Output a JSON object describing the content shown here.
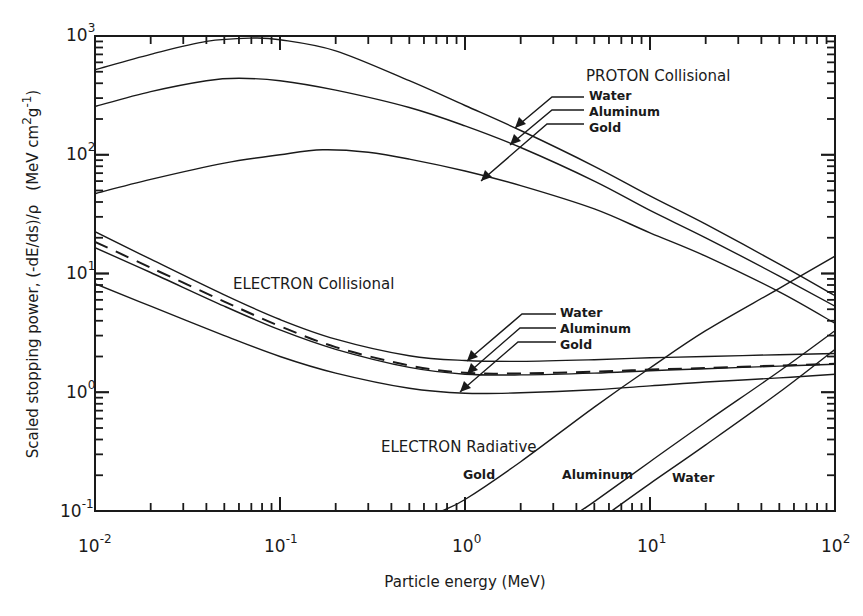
{
  "chart_data": {
    "type": "line",
    "scale": {
      "x": "log",
      "y": "log"
    },
    "title": "",
    "xlabel": "Particle energy (MeV)",
    "ylabel": "Scaled stopping power, (-dE/ds)/ρ  (MeV cm²g⁻¹)",
    "xlim": [
      0.01,
      100
    ],
    "ylim": [
      0.1,
      1000
    ],
    "x_ticks": [
      {
        "base": "10",
        "exp": "-2",
        "value": 0.01
      },
      {
        "base": "10",
        "exp": "-1",
        "value": 0.1
      },
      {
        "base": "10",
        "exp": "0",
        "value": 1
      },
      {
        "base": "10",
        "exp": "1",
        "value": 10
      },
      {
        "base": "10",
        "exp": "2",
        "value": 100
      }
    ],
    "y_ticks": [
      {
        "base": "10",
        "exp": "-1",
        "value": 0.1
      },
      {
        "base": "10",
        "exp": "0",
        "value": 1
      },
      {
        "base": "10",
        "exp": "1",
        "value": 10
      },
      {
        "base": "10",
        "exp": "2",
        "value": 100
      },
      {
        "base": "10",
        "exp": "3",
        "value": 1000
      }
    ],
    "grid": false,
    "legend": "inline annotations with leader arrows",
    "series": [
      {
        "name": "PROTON Collisional - Water",
        "group": "proton-collisional",
        "material": "Water",
        "style": "solid",
        "x": [
          0.01,
          0.02,
          0.04,
          0.07,
          0.1,
          0.2,
          0.5,
          1,
          2,
          5,
          10,
          20,
          50,
          100
        ],
        "y": [
          520,
          700,
          900,
          960,
          930,
          750,
          420,
          260,
          160,
          80,
          45,
          26,
          12,
          6.5
        ]
      },
      {
        "name": "PROTON Collisional - Aluminum",
        "group": "proton-collisional",
        "material": "Aluminum",
        "style": "solid",
        "x": [
          0.01,
          0.02,
          0.04,
          0.06,
          0.1,
          0.2,
          0.5,
          1,
          2,
          5,
          10,
          20,
          50,
          100
        ],
        "y": [
          255,
          340,
          420,
          440,
          420,
          350,
          250,
          175,
          115,
          60,
          34,
          20,
          9.5,
          5.3
        ]
      },
      {
        "name": "PROTON Collisional - Gold",
        "group": "proton-collisional",
        "material": "Gold",
        "style": "solid",
        "x": [
          0.01,
          0.02,
          0.05,
          0.1,
          0.17,
          0.3,
          0.5,
          1,
          2,
          5,
          10,
          20,
          50,
          100
        ],
        "y": [
          47,
          62,
          85,
          100,
          110,
          105,
          92,
          73,
          55,
          35,
          22,
          14,
          7,
          3.8
        ]
      },
      {
        "name": "ELECTRON Collisional - Water",
        "group": "electron-collisional",
        "material": "Water",
        "style": "solid",
        "x": [
          0.01,
          0.02,
          0.05,
          0.1,
          0.2,
          0.5,
          1,
          2,
          5,
          10,
          20,
          50,
          100
        ],
        "y": [
          22.5,
          13.2,
          6.6,
          4.1,
          2.8,
          2.03,
          1.85,
          1.82,
          1.88,
          1.95,
          2.0,
          2.07,
          2.12
        ]
      },
      {
        "name": "ELECTRON Collisional - Aluminum (dashed)",
        "group": "electron-collisional",
        "material": "Aluminum",
        "style": "dashed",
        "x": [
          0.01,
          0.02,
          0.05,
          0.1,
          0.2,
          0.5,
          1,
          2,
          5,
          10,
          20,
          50,
          100
        ],
        "y": [
          18.5,
          11.2,
          5.8,
          3.6,
          2.4,
          1.68,
          1.46,
          1.44,
          1.49,
          1.55,
          1.6,
          1.68,
          1.74
        ]
      },
      {
        "name": "ELECTRON Collisional - Gold",
        "group": "electron-collisional",
        "material": "Gold",
        "style": "solid",
        "x": [
          0.01,
          0.02,
          0.05,
          0.1,
          0.2,
          0.5,
          1,
          2,
          5,
          10,
          20,
          50,
          100
        ],
        "y": [
          8.2,
          5.3,
          3.0,
          2.0,
          1.45,
          1.08,
          0.98,
          0.99,
          1.05,
          1.13,
          1.22,
          1.32,
          1.42
        ]
      },
      {
        "name": "ELECTRON Collisional - additional solid curve",
        "group": "electron-collisional",
        "material": "",
        "style": "solid",
        "x": [
          0.01,
          0.02,
          0.05,
          0.1,
          0.2,
          0.5,
          1,
          2,
          5,
          10,
          20,
          50,
          100
        ],
        "y": [
          16.5,
          10.2,
          5.3,
          3.35,
          2.3,
          1.62,
          1.42,
          1.4,
          1.45,
          1.52,
          1.58,
          1.66,
          1.72
        ]
      },
      {
        "name": "ELECTRON Radiative - Gold",
        "group": "electron-radiative",
        "material": "Gold",
        "style": "solid",
        "x": [
          0.75,
          1,
          2,
          5,
          10,
          20,
          50,
          100
        ],
        "y": [
          0.1,
          0.125,
          0.26,
          0.75,
          1.6,
          3.3,
          7.5,
          14
        ]
      },
      {
        "name": "ELECTRON Radiative - Aluminum",
        "group": "electron-radiative",
        "material": "Aluminum",
        "style": "solid",
        "x": [
          4.2,
          5,
          10,
          20,
          50,
          100
        ],
        "y": [
          0.1,
          0.12,
          0.26,
          0.56,
          1.5,
          3.3
        ]
      },
      {
        "name": "ELECTRON Radiative - Water",
        "group": "electron-radiative",
        "material": "Water",
        "style": "solid",
        "x": [
          6.2,
          10,
          20,
          50,
          100
        ],
        "y": [
          0.1,
          0.17,
          0.36,
          1.0,
          2.3
        ]
      }
    ],
    "annotations": [
      {
        "text": "PROTON Collisional",
        "x": 2.8,
        "y": 600
      },
      {
        "text": "ELECTRON Collisional",
        "x": 0.025,
        "y": 7
      },
      {
        "text": "ELECTRON Radiative",
        "x": 0.25,
        "y": 0.45
      },
      {
        "text": "Water",
        "x": 3.6,
        "y": 330,
        "points_to_series": "PROTON Collisional - Water"
      },
      {
        "text": "Aluminum",
        "x": 3.6,
        "y": 250,
        "points_to_series": "PROTON Collisional - Aluminum"
      },
      {
        "text": "Gold",
        "x": 3.6,
        "y": 190,
        "points_to_series": "PROTON Collisional - Gold"
      },
      {
        "text": "Water",
        "x": 3.0,
        "y": 2.9,
        "points_to_series": "ELECTRON Collisional - Water"
      },
      {
        "text": "Aluminum",
        "x": 3.0,
        "y": 2.3,
        "points_to_series": "ELECTRON Collisional - Aluminum (dashed)"
      },
      {
        "text": "Gold",
        "x": 3.0,
        "y": 1.8,
        "points_to_series": "ELECTRON Collisional - Gold"
      },
      {
        "text": "Gold",
        "x": 0.42,
        "y": 0.22,
        "labels_series": "ELECTRON Radiative - Gold"
      },
      {
        "text": "Aluminum",
        "x": 3.0,
        "y": 0.22,
        "labels_series": "ELECTRON Radiative - Aluminum"
      },
      {
        "text": "Water",
        "x": 11,
        "y": 0.2,
        "labels_series": "ELECTRON Radiative - Water"
      }
    ]
  },
  "labels": {
    "x_axis_title": "Particle energy (MeV)",
    "y_axis_title": "Scaled stopping power, (-dE/ds)/ρ  (MeV cm²g⁻¹)",
    "y_axis_title_main": "Scaled stopping power, (-dE/ds)/ρ",
    "y_axis_unit_pre": "(MeV cm",
    "y_axis_unit_sup1": "2",
    "y_axis_unit_mid": "g",
    "y_axis_unit_sup2": "-1",
    "y_axis_unit_post": ")",
    "proton_group": "PROTON Collisional",
    "electron_coll_group": "ELECTRON Collisional",
    "electron_rad_group": "ELECTRON Radiative",
    "proton_water": "Water",
    "proton_aluminum": "Aluminum",
    "proton_gold": "Gold",
    "ecoll_water": "Water",
    "ecoll_aluminum": "Aluminum",
    "ecoll_gold": "Gold",
    "erad_gold": "Gold",
    "erad_aluminum": "Aluminum",
    "erad_water": "Water"
  },
  "ticks": {
    "x": [
      {
        "base": "10",
        "exp": "-2"
      },
      {
        "base": "10",
        "exp": "-1"
      },
      {
        "base": "10",
        "exp": "0"
      },
      {
        "base": "10",
        "exp": "1"
      },
      {
        "base": "10",
        "exp": "2"
      }
    ],
    "y": [
      {
        "base": "10",
        "exp": "3"
      },
      {
        "base": "10",
        "exp": "2"
      },
      {
        "base": "10",
        "exp": "1"
      },
      {
        "base": "10",
        "exp": "0"
      },
      {
        "base": "10",
        "exp": "-1"
      }
    ]
  }
}
